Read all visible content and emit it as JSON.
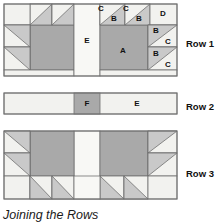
{
  "figure": {
    "caption": "Joining the Rows",
    "colors": {
      "dark_fabric": "#a9a9a9",
      "medium_fabric": "#c9c9c9",
      "light_fabric": "#f2f2ef",
      "outline": "#707070",
      "text": "#111111"
    }
  },
  "rows": [
    {
      "label": "Row 1",
      "patches": [
        {
          "name": "C",
          "x": 101,
          "y": 8
        },
        {
          "name": "B",
          "x": 113,
          "y": 18
        },
        {
          "name": "C",
          "x": 126,
          "y": 8
        },
        {
          "name": "B",
          "x": 138,
          "y": 18
        },
        {
          "name": "D",
          "x": 162,
          "y": 13
        },
        {
          "name": "E",
          "x": 88,
          "y": 40
        },
        {
          "name": "A",
          "x": 124,
          "y": 50
        },
        {
          "name": "B",
          "x": 155,
          "y": 33
        },
        {
          "name": "C",
          "x": 167,
          "y": 43
        },
        {
          "name": "B",
          "x": 155,
          "y": 57
        },
        {
          "name": "C",
          "x": 167,
          "y": 67
        }
      ]
    },
    {
      "label": "Row 2",
      "patches": [
        {
          "name": "F",
          "x": 97,
          "y": 103
        },
        {
          "name": "E",
          "x": 137,
          "y": 103
        }
      ]
    },
    {
      "label": "Row 3",
      "patches": []
    }
  ],
  "row_labels": [
    {
      "text": "Row 1",
      "x": 186,
      "y": 44
    },
    {
      "text": "Row 2",
      "x": 186,
      "y": 107
    },
    {
      "text": "Row 3",
      "x": 186,
      "y": 174
    }
  ]
}
